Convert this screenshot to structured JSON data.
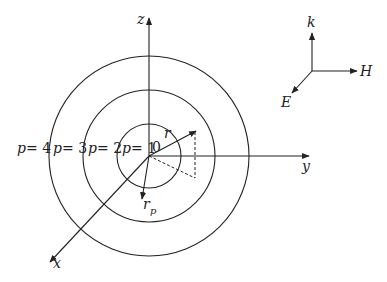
{
  "diagram": {
    "axes": {
      "z": "z",
      "y": "y",
      "x": "x"
    },
    "origin_label": "0",
    "vectors": {
      "r": "r",
      "rp_main": "r",
      "rp_sub": "p"
    },
    "rings": [
      {
        "label_var": "p",
        "label_eq": "= 1"
      },
      {
        "label_var": "p",
        "label_eq": "= 2"
      },
      {
        "label_var": "p",
        "label_eq": "= 3"
      },
      {
        "label_var": "p",
        "label_eq": "= 4"
      }
    ],
    "triad": {
      "k": "k",
      "H": "H",
      "E": "E"
    },
    "colors": {
      "stroke": "#222222",
      "background": "#ffffff"
    }
  }
}
